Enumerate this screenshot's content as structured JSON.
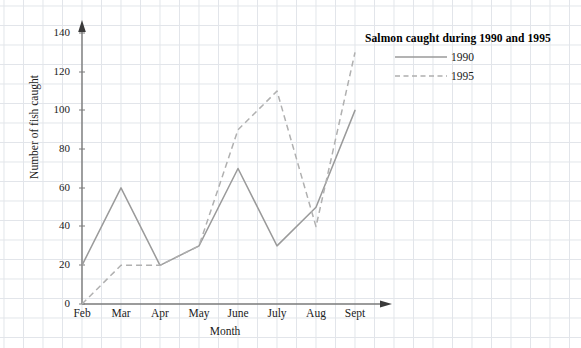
{
  "chart_data": {
    "type": "line",
    "title": "Salmon caught during 1990 and 1995",
    "xlabel": "Month",
    "ylabel": "Number of fish caught",
    "categories": [
      "Feb",
      "Mar",
      "Apr",
      "May",
      "June",
      "July",
      "Aug",
      "Sept"
    ],
    "series": [
      {
        "name": "1990",
        "style": "solid",
        "color": "#9a9a9a",
        "values": [
          20,
          60,
          20,
          30,
          70,
          30,
          50,
          100
        ]
      },
      {
        "name": "1995",
        "style": "dashed",
        "color": "#b0b0b0",
        "values": [
          0,
          20,
          20,
          30,
          90,
          110,
          40,
          130
        ]
      }
    ],
    "ylim": [
      0,
      140
    ],
    "yticks": [
      0,
      20,
      40,
      60,
      80,
      100,
      120,
      140
    ],
    "ytick_labels": [
      "0",
      "20",
      "40",
      "60",
      "80",
      "100",
      "120",
      "140"
    ],
    "grid": true,
    "legend_position": "top-right",
    "axis_color": "#8a8a8a",
    "grid_color": "#d9dde3"
  },
  "legend": {
    "title": "Salmon caught during 1990 and 1995",
    "entries": [
      {
        "label": "1990"
      },
      {
        "label": "1995"
      }
    ]
  },
  "axes": {
    "y_title": "Number of fish caught",
    "x_title": "Month"
  }
}
